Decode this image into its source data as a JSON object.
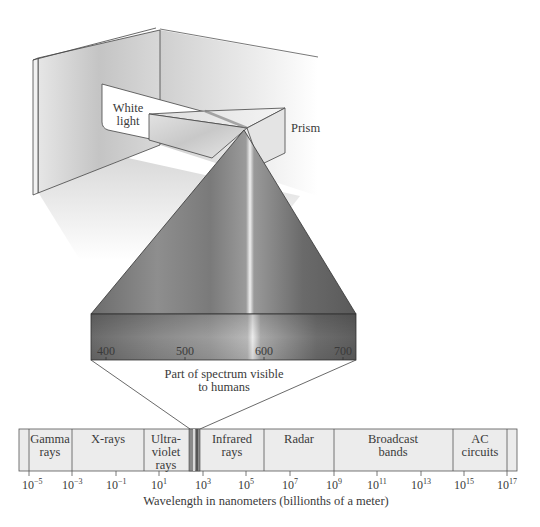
{
  "illustration": {
    "white_light_label": [
      "White",
      "light"
    ],
    "prism_label": "Prism"
  },
  "visible_spectrum": {
    "ticks": [
      "400",
      "500",
      "600",
      "700"
    ],
    "caption": [
      "Part of spectrum visible",
      "to humans"
    ]
  },
  "em_spectrum": {
    "bands": [
      {
        "name": "gamma",
        "lines": [
          "Gamma",
          "rays"
        ]
      },
      {
        "name": "xray",
        "lines": [
          "X-rays"
        ]
      },
      {
        "name": "uv",
        "lines": [
          "Ultra-",
          "violet",
          "rays"
        ]
      },
      {
        "name": "infrared",
        "lines": [
          "Infrared",
          "rays"
        ]
      },
      {
        "name": "radar",
        "lines": [
          "Radar"
        ]
      },
      {
        "name": "broadcast",
        "lines": [
          "Broadcast",
          "bands"
        ]
      },
      {
        "name": "ac",
        "lines": [
          "AC",
          "circuits"
        ]
      }
    ],
    "ticks": [
      {
        "base": "10",
        "exp": "−5"
      },
      {
        "base": "10",
        "exp": "−3"
      },
      {
        "base": "10",
        "exp": "−1"
      },
      {
        "base": "10",
        "exp": "1"
      },
      {
        "base": "10",
        "exp": "3"
      },
      {
        "base": "10",
        "exp": "5"
      },
      {
        "base": "10",
        "exp": "7"
      },
      {
        "base": "10",
        "exp": "9"
      },
      {
        "base": "10",
        "exp": "11"
      },
      {
        "base": "10",
        "exp": "13"
      },
      {
        "base": "10",
        "exp": "15"
      },
      {
        "base": "10",
        "exp": "17"
      }
    ],
    "axis_label": "Wavelength in nanometers (billionths of a meter)"
  }
}
